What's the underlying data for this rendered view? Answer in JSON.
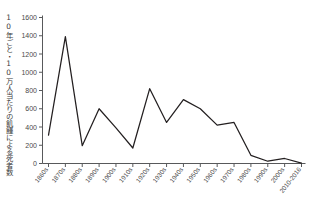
{
  "chart_data": {
    "type": "line",
    "title": "",
    "xlabel": "",
    "ylabel": "10年ごと・10万人当たりの飢饉による死者数",
    "ylim": [
      0,
      1600
    ],
    "ytick_step": 200,
    "grid": false,
    "legend": "none",
    "line_color": "#231f20",
    "axis_color": "#58595b",
    "categories": [
      "1860s",
      "1870s",
      "1880s",
      "1890s",
      "1900s",
      "1910s",
      "1920s",
      "1930s",
      "1940s",
      "1950s",
      "1960s",
      "1970s",
      "1980s",
      "1990s",
      "2000s",
      "2010-2016"
    ],
    "values": [
      310,
      1390,
      195,
      600,
      390,
      170,
      820,
      450,
      700,
      600,
      420,
      450,
      90,
      25,
      55,
      5
    ],
    "yticks": [
      "0",
      "200",
      "400",
      "600",
      "800",
      "1000",
      "1200",
      "1400",
      "1600"
    ],
    "ytick_values": [
      0,
      200,
      400,
      600,
      800,
      1000,
      1200,
      1400,
      1600
    ]
  }
}
